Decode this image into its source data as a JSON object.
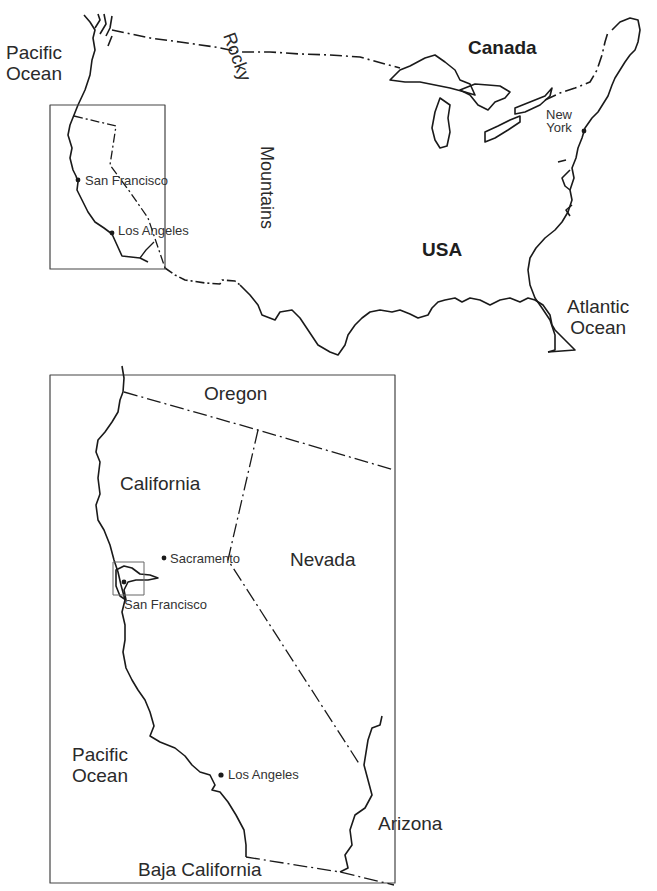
{
  "overview_map": {
    "labels": {
      "pacific_ocean": "Pacific\nOcean",
      "canada": "Canada",
      "rocky": "Rocky",
      "mountains": "Mountains",
      "usa": "USA",
      "atlantic_ocean": "Atlantic\nOcean",
      "new_york": "New\nYork",
      "san_francisco": "San Francisco",
      "los_angeles": "Los Angeles"
    }
  },
  "detail_map": {
    "labels": {
      "oregon": "Oregon",
      "california": "California",
      "nevada": "Nevada",
      "sacramento": "Sacramento",
      "san_francisco": "San Francisco",
      "pacific_ocean": "Pacific\nOcean",
      "los_angeles": "Los Angeles",
      "arizona": "Arizona",
      "baja_california": "Baja California"
    }
  },
  "colors": {
    "line": "#1a1a1a",
    "frame": "#444444",
    "background": "#ffffff"
  }
}
